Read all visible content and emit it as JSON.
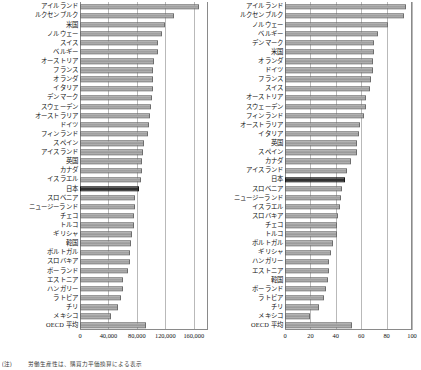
{
  "figure": {
    "highlight_country": "日本",
    "footnote_mark": "(注)",
    "footnote_text": "労働生産性は、購買力平価換算による表示"
  },
  "colors": {
    "bar_fill": "#a8a8a8",
    "bar_border": "#6e6e6e",
    "highlight_fill": "#2c2c2c",
    "highlight_border": "#171717",
    "gridline": "#b9b9b9",
    "axis": "#8a8a8a"
  },
  "chart_data": [
    {
      "type": "bar",
      "orientation": "horizontal",
      "title": "",
      "xlabel": "",
      "ylabel": "",
      "xlim": [
        0,
        180000
      ],
      "xticks": [
        0,
        40000,
        80000,
        120000,
        160000
      ],
      "xtick_labels": [
        "0",
        "40,000",
        "80,000",
        "120,000",
        "160,000"
      ],
      "grid": true,
      "legend": "none",
      "highlight": "日本",
      "categories": [
        "アイルランド",
        "ルクセンブルク",
        "米国",
        "ノルウェー",
        "スイス",
        "ベルギー",
        "オーストリア",
        "フランス",
        "オランダ",
        "イタリア",
        "デンマーク",
        "スウェーデン",
        "オーストラリア",
        "ドイツ",
        "フィンランド",
        "スペイン",
        "アイスランド",
        "英国",
        "カナダ",
        "イスラエル",
        "日本",
        "スロベニア",
        "ニュージーランド",
        "チェコ",
        "トルコ",
        "ギリシャ",
        "韓国",
        "ポルトガル",
        "スロバキア",
        "ポーランド",
        "エストニア",
        "ハンガリー",
        "ラトビア",
        "チリ",
        "メキシコ",
        "OECD 平均"
      ],
      "values": [
        168000,
        132000,
        120000,
        116000,
        110000,
        109000,
        104000,
        103000,
        103000,
        102000,
        101000,
        100000,
        99000,
        97000,
        95000,
        90000,
        89000,
        87000,
        87000,
        86000,
        83000,
        77000,
        77000,
        76000,
        76000,
        73000,
        72000,
        71000,
        70000,
        67000,
        61000,
        61000,
        58000,
        53000,
        43000,
        93000
      ]
    },
    {
      "type": "bar",
      "orientation": "horizontal",
      "title": "",
      "xlabel": "",
      "ylabel": "",
      "xlim": [
        0,
        100
      ],
      "xticks": [
        0,
        20,
        40,
        60,
        80,
        100
      ],
      "xtick_labels": [
        "0",
        "20",
        "40",
        "60",
        "80",
        "100"
      ],
      "grid": true,
      "legend": "none",
      "highlight": "日本",
      "categories": [
        "アイルランド",
        "ルクセンブルク",
        "ノルウェー",
        "ベルギー",
        "デンマーク",
        "米国",
        "オランダ",
        "ドイツ",
        "フランス",
        "スイス",
        "オーストリア",
        "スウェーデン",
        "フィンランド",
        "オーストラリア",
        "イタリア",
        "英国",
        "スペイン",
        "カナダ",
        "アイスランド",
        "日本",
        "スロベニア",
        "ニュージーランド",
        "イスラエル",
        "スロバキア",
        "チェコ",
        "トルコ",
        "ポルトガル",
        "ギリシャ",
        "ハンガリー",
        "エストニア",
        "韓国",
        "ポーランド",
        "ラトビア",
        "チリ",
        "メキシコ",
        "OECD 平均"
      ],
      "values": [
        95,
        94,
        81,
        73,
        70,
        70,
        69,
        69,
        68,
        67,
        64,
        64,
        62,
        59,
        58,
        57,
        57,
        52,
        49,
        47,
        45,
        44,
        43,
        42,
        41,
        41,
        38,
        36,
        35,
        35,
        34,
        32,
        31,
        27,
        20,
        53
      ]
    }
  ]
}
